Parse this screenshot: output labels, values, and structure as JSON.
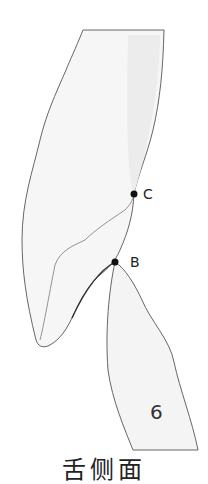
{
  "diagram": {
    "type": "dental-contact-diagram",
    "points": [
      {
        "id": "C",
        "label": "C",
        "x": 134,
        "y": 194
      },
      {
        "id": "B",
        "label": "B",
        "x": 115,
        "y": 262
      }
    ],
    "tooth_number": "6",
    "caption": "舌侧面",
    "colors": {
      "outline": "#555555",
      "fill": "#f4f4f4",
      "point": "#111111"
    }
  }
}
